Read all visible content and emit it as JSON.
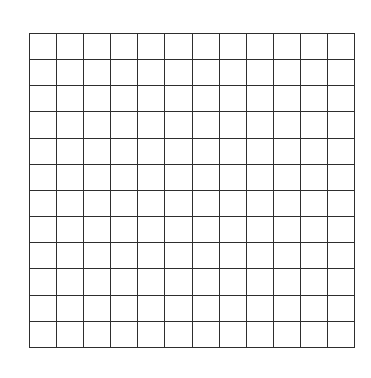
{
  "grid": {
    "rows": 12,
    "columns": 12,
    "line_color": "#2e2e2e",
    "background_color": "#ffffff"
  }
}
